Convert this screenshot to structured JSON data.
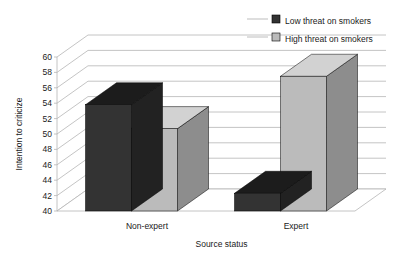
{
  "chart_data": {
    "type": "bar",
    "title": "",
    "subtitle": "",
    "xlabel": "Source status",
    "ylabel": "Intention to criticize",
    "categories": [
      "Non-expert",
      "Expert"
    ],
    "series": [
      {
        "name": "Low threat on smokers",
        "color": "#333333",
        "values": [
          53.8,
          42.3
        ]
      },
      {
        "name": "High threat on smokers",
        "color": "#bbbbbb",
        "values": [
          50.7,
          57.5
        ]
      }
    ],
    "ylim": [
      40,
      60
    ],
    "yticks": [
      40,
      42,
      44,
      46,
      48,
      50,
      52,
      54,
      56,
      58,
      60
    ],
    "ytick_labels": [
      "40",
      "42",
      "44",
      "46",
      "48",
      "50",
      "52",
      "54",
      "56",
      "58",
      "60"
    ],
    "grid": true,
    "grid_axis": "y",
    "legend_position": "top-right",
    "legend": [
      {
        "label": "Low threat on smokers",
        "swatch_color": "#333333"
      },
      {
        "label": "High threat on smokers",
        "swatch_color": "#bbbbbb"
      }
    ],
    "style": "3d-column",
    "background": "#ffffff"
  },
  "colors": {
    "dark_front": "#333333",
    "dark_top": "#1c1c1c",
    "dark_side": "#222222",
    "light_front": "#bbbbbb",
    "light_top": "#d2d2d2",
    "light_side": "#8d8d8d",
    "grid": "#b5b5b5",
    "floor": "#ffffff",
    "text": "#1a1a1a"
  }
}
